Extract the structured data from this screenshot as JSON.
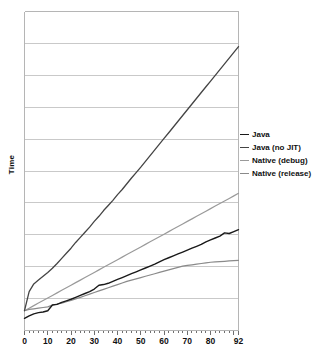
{
  "chart_data": {
    "type": "line",
    "title": "",
    "xlabel": "",
    "ylabel": "Time",
    "xlim": [
      0,
      92
    ],
    "ylim": [
      0,
      10
    ],
    "grid": "horizontal",
    "gridlines_y": 11,
    "legend_position": "right",
    "xticks": [
      "0",
      "10",
      "20",
      "30",
      "40",
      "50",
      "60",
      "70",
      "80",
      "92"
    ],
    "xtick_values": [
      0,
      10,
      20,
      30,
      40,
      50,
      60,
      70,
      80,
      92
    ],
    "ytick_labels": [],
    "x": [
      0,
      2,
      4,
      6,
      8,
      10,
      12,
      14,
      16,
      18,
      20,
      22,
      24,
      26,
      28,
      30,
      32,
      34,
      36,
      38,
      40,
      42,
      44,
      46,
      48,
      50,
      52,
      54,
      56,
      58,
      60,
      62,
      64,
      66,
      68,
      70,
      72,
      74,
      76,
      78,
      80,
      82,
      84,
      86,
      88,
      90,
      92
    ],
    "series": [
      {
        "name": "Java",
        "color": "#1a1a1a",
        "width": 1.4,
        "values": [
          0.38,
          0.46,
          0.52,
          0.56,
          0.58,
          0.62,
          0.8,
          0.82,
          0.88,
          0.93,
          0.98,
          1.04,
          1.1,
          1.16,
          1.22,
          1.3,
          1.42,
          1.44,
          1.48,
          1.54,
          1.6,
          1.66,
          1.72,
          1.78,
          1.84,
          1.9,
          1.96,
          2.02,
          2.08,
          2.15,
          2.22,
          2.28,
          2.34,
          2.4,
          2.46,
          2.52,
          2.58,
          2.64,
          2.7,
          2.78,
          2.84,
          2.9,
          2.96,
          3.06,
          3.04,
          3.1,
          3.16
        ]
      },
      {
        "name": "Java (no JIT)",
        "color": "#444444",
        "width": 1.3,
        "values": [
          0.62,
          1.22,
          1.46,
          1.58,
          1.7,
          1.82,
          1.95,
          2.1,
          2.26,
          2.42,
          2.58,
          2.76,
          2.92,
          3.08,
          3.24,
          3.42,
          3.58,
          3.76,
          3.92,
          4.08,
          4.26,
          4.42,
          4.6,
          4.78,
          4.95,
          5.12,
          5.3,
          5.48,
          5.66,
          5.84,
          6.02,
          6.2,
          6.38,
          6.56,
          6.74,
          6.92,
          7.1,
          7.28,
          7.46,
          7.64,
          7.82,
          8.0,
          8.18,
          8.36,
          8.54,
          8.72,
          8.9
        ]
      },
      {
        "name": "Native (debug)",
        "color": "#9a9a9a",
        "width": 1.2,
        "values": [
          0.62,
          0.7,
          0.78,
          0.86,
          0.94,
          1.02,
          1.1,
          1.18,
          1.26,
          1.34,
          1.42,
          1.5,
          1.58,
          1.66,
          1.74,
          1.82,
          1.9,
          1.98,
          2.06,
          2.14,
          2.22,
          2.3,
          2.38,
          2.46,
          2.54,
          2.62,
          2.7,
          2.78,
          2.86,
          2.94,
          3.02,
          3.1,
          3.18,
          3.26,
          3.34,
          3.42,
          3.5,
          3.58,
          3.66,
          3.74,
          3.82,
          3.9,
          3.98,
          4.06,
          4.14,
          4.22,
          4.3
        ]
      },
      {
        "name": "Native (release)",
        "color": "#8a8a8a",
        "width": 1.2,
        "values": [
          0.62,
          0.66,
          0.68,
          0.7,
          0.72,
          0.74,
          0.8,
          0.83,
          0.86,
          0.9,
          0.94,
          0.99,
          1.04,
          1.09,
          1.14,
          1.19,
          1.24,
          1.29,
          1.34,
          1.39,
          1.44,
          1.49,
          1.54,
          1.58,
          1.62,
          1.66,
          1.7,
          1.74,
          1.78,
          1.82,
          1.86,
          1.9,
          1.94,
          1.98,
          2.02,
          2.04,
          2.06,
          2.08,
          2.1,
          2.12,
          2.14,
          2.15,
          2.16,
          2.17,
          2.18,
          2.19,
          2.2
        ]
      }
    ]
  },
  "legend": {
    "items": [
      {
        "label": "Java"
      },
      {
        "label": "Java (no JIT)"
      },
      {
        "label": "Native (debug)"
      },
      {
        "label": "Native (release)"
      }
    ]
  },
  "axes": {
    "y_title": "Time"
  },
  "colors": {
    "plot_border": "#b5b5b5",
    "gridline": "#c9c9c9",
    "tick": "#6f6f6f",
    "text": "#111111",
    "background": "#ffffff"
  }
}
